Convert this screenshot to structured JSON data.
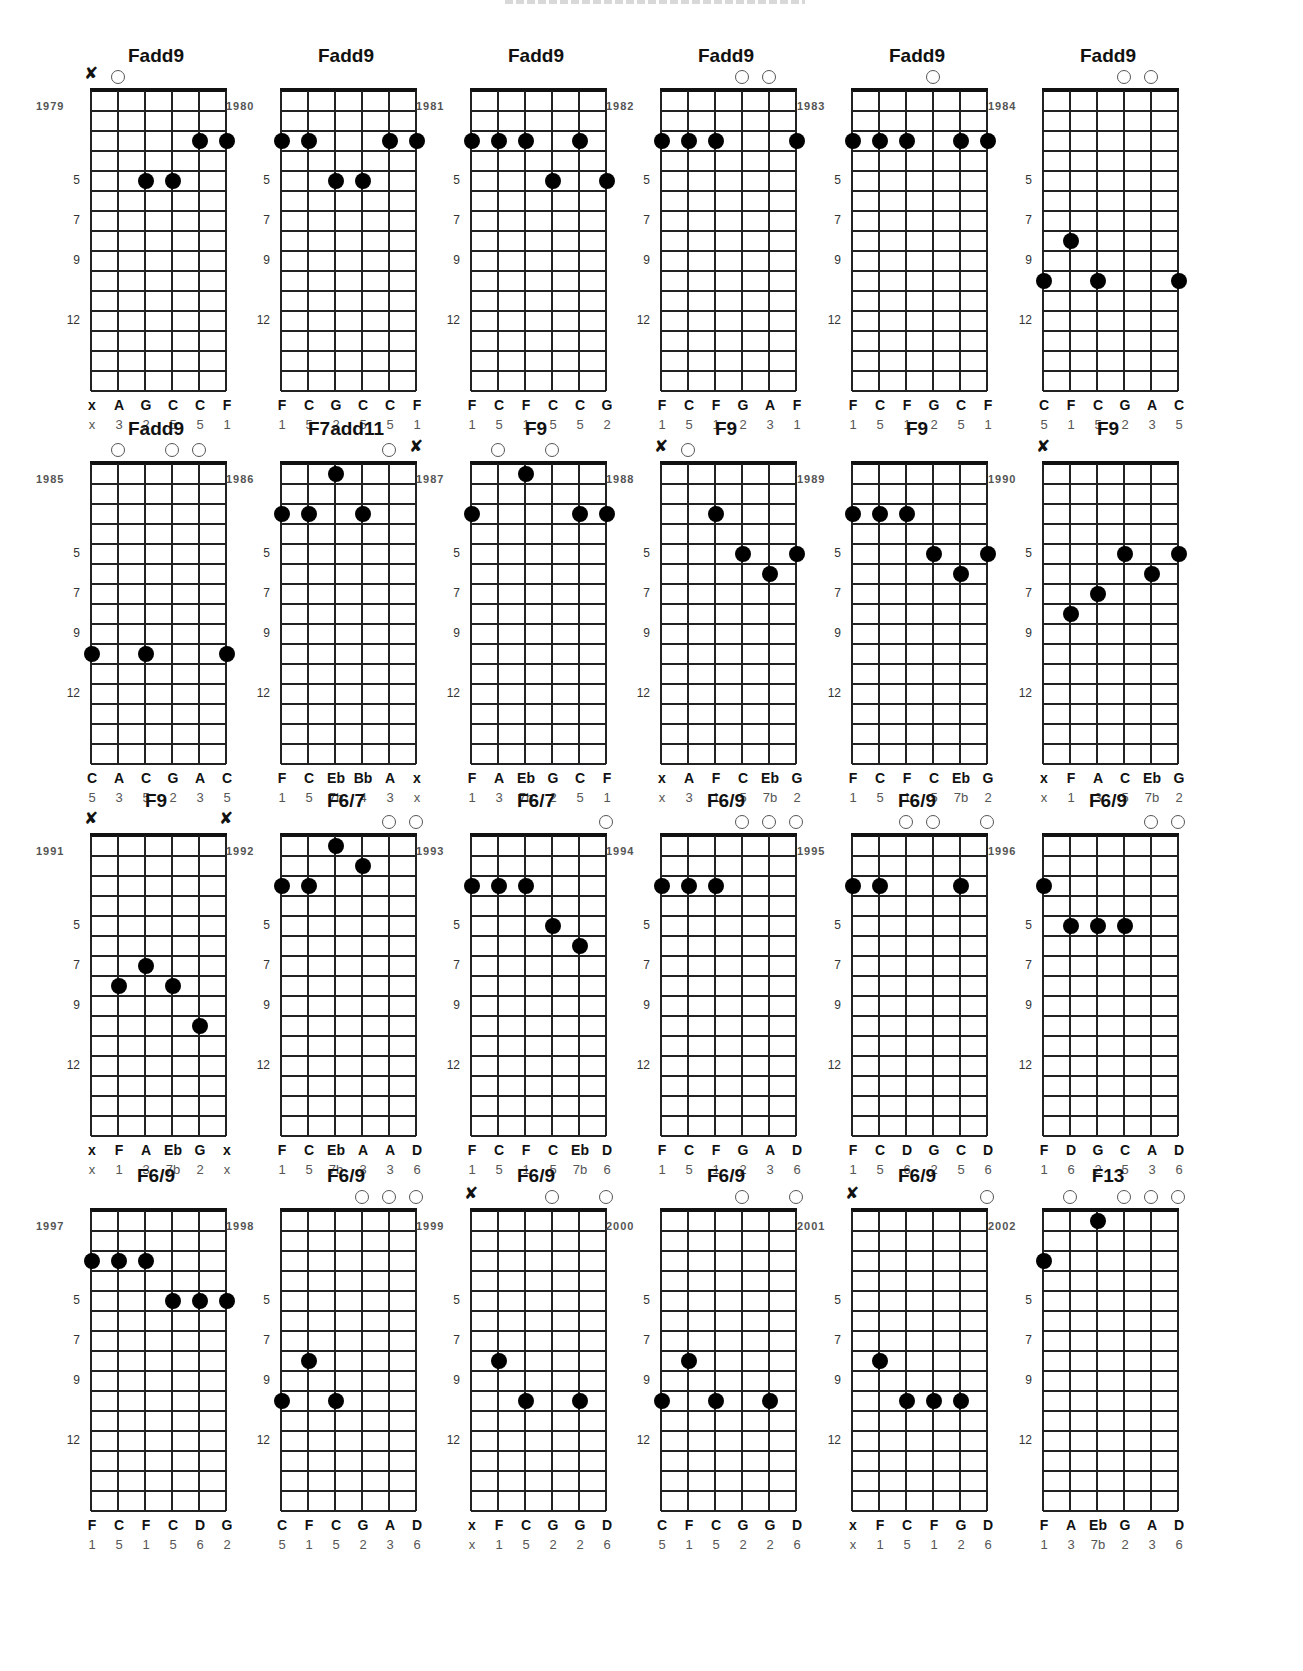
{
  "document": {
    "layout": {
      "columns": 6,
      "rows": 4,
      "strings": 6,
      "fret_spaces": 15
    },
    "fret_markers": [
      "5",
      "7",
      "9",
      "12"
    ],
    "colors": {
      "ink": "#111111",
      "secondary_text": "#555555",
      "background": "#ffffff"
    }
  },
  "chords": [
    {
      "year": "1979",
      "name": "Fadd9",
      "markers": [
        "x",
        "o",
        "",
        "",
        "",
        ""
      ],
      "dots": [
        [
          4,
          3
        ],
        [
          5,
          3
        ],
        [
          2,
          5
        ],
        [
          3,
          5
        ]
      ],
      "notes": [
        "x",
        "A",
        "G",
        "C",
        "C",
        "F"
      ],
      "degrees": [
        "x",
        "3",
        "2",
        "5",
        "5",
        "1"
      ]
    },
    {
      "year": "1980",
      "name": "Fadd9",
      "markers": [
        "",
        "",
        "",
        "",
        "",
        ""
      ],
      "dots": [
        [
          0,
          3
        ],
        [
          1,
          3
        ],
        [
          4,
          3
        ],
        [
          5,
          3
        ],
        [
          2,
          5
        ],
        [
          3,
          5
        ]
      ],
      "notes": [
        "F",
        "C",
        "G",
        "C",
        "C",
        "F"
      ],
      "degrees": [
        "1",
        "5",
        "2",
        "5",
        "5",
        "1"
      ]
    },
    {
      "year": "1981",
      "name": "Fadd9",
      "markers": [
        "",
        "",
        "",
        "",
        "",
        ""
      ],
      "dots": [
        [
          0,
          3
        ],
        [
          1,
          3
        ],
        [
          2,
          3
        ],
        [
          4,
          3
        ],
        [
          3,
          5
        ],
        [
          5,
          5
        ]
      ],
      "notes": [
        "F",
        "C",
        "F",
        "C",
        "C",
        "G"
      ],
      "degrees": [
        "1",
        "5",
        "1",
        "5",
        "5",
        "2"
      ]
    },
    {
      "year": "1982",
      "name": "Fadd9",
      "markers": [
        "",
        "",
        "",
        "o",
        "o",
        ""
      ],
      "dots": [
        [
          0,
          3
        ],
        [
          1,
          3
        ],
        [
          2,
          3
        ],
        [
          5,
          3
        ]
      ],
      "notes": [
        "F",
        "C",
        "F",
        "G",
        "A",
        "F"
      ],
      "degrees": [
        "1",
        "5",
        "1",
        "2",
        "3",
        "1"
      ]
    },
    {
      "year": "1983",
      "name": "Fadd9",
      "markers": [
        "",
        "",
        "",
        "o",
        "",
        ""
      ],
      "dots": [
        [
          0,
          3
        ],
        [
          1,
          3
        ],
        [
          2,
          3
        ],
        [
          4,
          3
        ],
        [
          5,
          3
        ]
      ],
      "notes": [
        "F",
        "C",
        "F",
        "G",
        "C",
        "F"
      ],
      "degrees": [
        "1",
        "5",
        "1",
        "2",
        "5",
        "1"
      ]
    },
    {
      "year": "1984",
      "name": "Fadd9",
      "markers": [
        "",
        "",
        "",
        "o",
        "o",
        ""
      ],
      "dots": [
        [
          1,
          8
        ],
        [
          0,
          10
        ],
        [
          2,
          10
        ],
        [
          5,
          10
        ]
      ],
      "notes": [
        "C",
        "F",
        "C",
        "G",
        "A",
        "C"
      ],
      "degrees": [
        "5",
        "1",
        "5",
        "2",
        "3",
        "5"
      ]
    },
    {
      "year": "1985",
      "name": "Fadd9",
      "markers": [
        "",
        "o",
        "",
        "o",
        "o",
        ""
      ],
      "dots": [
        [
          0,
          10
        ],
        [
          2,
          10
        ],
        [
          5,
          10
        ]
      ],
      "notes": [
        "C",
        "A",
        "C",
        "G",
        "A",
        "C"
      ],
      "degrees": [
        "5",
        "3",
        "5",
        "2",
        "3",
        "5"
      ]
    },
    {
      "year": "1986",
      "name": "F7add11",
      "markers": [
        "",
        "",
        "",
        "",
        "o",
        "x"
      ],
      "dots": [
        [
          2,
          1
        ],
        [
          0,
          3
        ],
        [
          1,
          3
        ],
        [
          3,
          3
        ]
      ],
      "notes": [
        "F",
        "C",
        "Eb",
        "Bb",
        "A",
        "x"
      ],
      "degrees": [
        "1",
        "5",
        "7b",
        "4",
        "3",
        "x"
      ]
    },
    {
      "year": "1987",
      "name": "F9",
      "markers": [
        "",
        "o",
        "",
        "o",
        "",
        ""
      ],
      "dots": [
        [
          2,
          1
        ],
        [
          0,
          3
        ],
        [
          4,
          3
        ],
        [
          5,
          3
        ]
      ],
      "notes": [
        "F",
        "A",
        "Eb",
        "G",
        "C",
        "F"
      ],
      "degrees": [
        "1",
        "3",
        "7b",
        "2",
        "5",
        "1"
      ]
    },
    {
      "year": "1988",
      "name": "F9",
      "markers": [
        "x",
        "o",
        "",
        "",
        "",
        ""
      ],
      "dots": [
        [
          2,
          3
        ],
        [
          3,
          5
        ],
        [
          5,
          5
        ],
        [
          4,
          6
        ]
      ],
      "notes": [
        "x",
        "A",
        "F",
        "C",
        "Eb",
        "G"
      ],
      "degrees": [
        "x",
        "3",
        "1",
        "5",
        "7b",
        "2"
      ]
    },
    {
      "year": "1989",
      "name": "F9",
      "markers": [
        "",
        "",
        "",
        "",
        "",
        ""
      ],
      "dots": [
        [
          0,
          3
        ],
        [
          1,
          3
        ],
        [
          2,
          3
        ],
        [
          3,
          5
        ],
        [
          5,
          5
        ],
        [
          4,
          6
        ]
      ],
      "notes": [
        "F",
        "C",
        "F",
        "C",
        "Eb",
        "G"
      ],
      "degrees": [
        "1",
        "5",
        "1",
        "5",
        "7b",
        "2"
      ]
    },
    {
      "year": "1990",
      "name": "F9",
      "markers": [
        "x",
        "",
        "",
        "",
        "",
        ""
      ],
      "dots": [
        [
          3,
          5
        ],
        [
          5,
          5
        ],
        [
          4,
          6
        ],
        [
          2,
          7
        ],
        [
          1,
          8
        ]
      ],
      "notes": [
        "x",
        "F",
        "A",
        "C",
        "Eb",
        "G"
      ],
      "degrees": [
        "x",
        "1",
        "3",
        "5",
        "7b",
        "2"
      ]
    },
    {
      "year": "1991",
      "name": "F9",
      "markers": [
        "x",
        "",
        "",
        "",
        "",
        "x"
      ],
      "dots": [
        [
          2,
          7
        ],
        [
          1,
          8
        ],
        [
          3,
          8
        ],
        [
          4,
          10
        ]
      ],
      "notes": [
        "x",
        "F",
        "A",
        "Eb",
        "G",
        "x"
      ],
      "degrees": [
        "x",
        "1",
        "3",
        "7b",
        "2",
        "x"
      ]
    },
    {
      "year": "1992",
      "name": "F6/7",
      "markers": [
        "",
        "",
        "",
        "",
        "o",
        "o"
      ],
      "dots": [
        [
          2,
          1
        ],
        [
          3,
          2
        ],
        [
          0,
          3
        ],
        [
          1,
          3
        ]
      ],
      "notes": [
        "F",
        "C",
        "Eb",
        "A",
        "A",
        "D"
      ],
      "degrees": [
        "1",
        "5",
        "7b",
        "3",
        "3",
        "6"
      ]
    },
    {
      "year": "1993",
      "name": "F6/7",
      "markers": [
        "",
        "",
        "",
        "",
        "",
        "o"
      ],
      "dots": [
        [
          0,
          3
        ],
        [
          1,
          3
        ],
        [
          2,
          3
        ],
        [
          3,
          5
        ],
        [
          4,
          6
        ]
      ],
      "notes": [
        "F",
        "C",
        "F",
        "C",
        "Eb",
        "D"
      ],
      "degrees": [
        "1",
        "5",
        "1",
        "5",
        "7b",
        "6"
      ]
    },
    {
      "year": "1994",
      "name": "F6/9",
      "markers": [
        "",
        "",
        "",
        "o",
        "o",
        "o"
      ],
      "dots": [
        [
          0,
          3
        ],
        [
          1,
          3
        ],
        [
          2,
          3
        ]
      ],
      "notes": [
        "F",
        "C",
        "F",
        "G",
        "A",
        "D"
      ],
      "degrees": [
        "1",
        "5",
        "1",
        "2",
        "3",
        "6"
      ]
    },
    {
      "year": "1995",
      "name": "F6/9",
      "markers": [
        "",
        "",
        "o",
        "o",
        "",
        "o"
      ],
      "dots": [
        [
          0,
          3
        ],
        [
          1,
          3
        ],
        [
          4,
          3
        ]
      ],
      "notes": [
        "F",
        "C",
        "D",
        "G",
        "C",
        "D"
      ],
      "degrees": [
        "1",
        "5",
        "6",
        "2",
        "5",
        "6"
      ]
    },
    {
      "year": "1996",
      "name": "F6/9",
      "markers": [
        "",
        "",
        "",
        "",
        "o",
        "o"
      ],
      "dots": [
        [
          0,
          3
        ],
        [
          1,
          5
        ],
        [
          2,
          5
        ],
        [
          3,
          5
        ]
      ],
      "notes": [
        "F",
        "D",
        "G",
        "C",
        "A",
        "D"
      ],
      "degrees": [
        "1",
        "6",
        "2",
        "5",
        "3",
        "6"
      ]
    },
    {
      "year": "1997",
      "name": "F6/9",
      "markers": [
        "",
        "",
        "",
        "",
        "",
        ""
      ],
      "dots": [
        [
          0,
          3
        ],
        [
          1,
          3
        ],
        [
          2,
          3
        ],
        [
          3,
          5
        ],
        [
          4,
          5
        ],
        [
          5,
          5
        ]
      ],
      "notes": [
        "F",
        "C",
        "F",
        "C",
        "D",
        "G"
      ],
      "degrees": [
        "1",
        "5",
        "1",
        "5",
        "6",
        "2"
      ]
    },
    {
      "year": "1998",
      "name": "F6/9",
      "markers": [
        "",
        "",
        "",
        "o",
        "o",
        "o"
      ],
      "dots": [
        [
          1,
          8
        ],
        [
          0,
          10
        ],
        [
          2,
          10
        ]
      ],
      "notes": [
        "C",
        "F",
        "C",
        "G",
        "A",
        "D"
      ],
      "degrees": [
        "5",
        "1",
        "5",
        "2",
        "3",
        "6"
      ]
    },
    {
      "year": "1999",
      "name": "F6/9",
      "markers": [
        "x",
        "",
        "",
        "o",
        "",
        "o"
      ],
      "dots": [
        [
          1,
          8
        ],
        [
          2,
          10
        ],
        [
          4,
          10
        ]
      ],
      "notes": [
        "x",
        "F",
        "C",
        "G",
        "G",
        "D"
      ],
      "degrees": [
        "x",
        "1",
        "5",
        "2",
        "2",
        "6"
      ]
    },
    {
      "year": "2000",
      "name": "F6/9",
      "markers": [
        "",
        "",
        "",
        "o",
        "",
        "o"
      ],
      "dots": [
        [
          1,
          8
        ],
        [
          0,
          10
        ],
        [
          2,
          10
        ],
        [
          4,
          10
        ]
      ],
      "notes": [
        "C",
        "F",
        "C",
        "G",
        "G",
        "D"
      ],
      "degrees": [
        "5",
        "1",
        "5",
        "2",
        "2",
        "6"
      ]
    },
    {
      "year": "2001",
      "name": "F6/9",
      "markers": [
        "x",
        "",
        "",
        "",
        "",
        "o"
      ],
      "dots": [
        [
          1,
          8
        ],
        [
          2,
          10
        ],
        [
          3,
          10
        ],
        [
          4,
          10
        ]
      ],
      "notes": [
        "x",
        "F",
        "C",
        "F",
        "G",
        "D"
      ],
      "degrees": [
        "x",
        "1",
        "5",
        "1",
        "2",
        "6"
      ]
    },
    {
      "year": "2002",
      "name": "F13",
      "markers": [
        "",
        "o",
        "",
        "o",
        "o",
        "o"
      ],
      "dots": [
        [
          2,
          1
        ],
        [
          0,
          3
        ]
      ],
      "notes": [
        "F",
        "A",
        "Eb",
        "G",
        "A",
        "D"
      ],
      "degrees": [
        "1",
        "3",
        "7b",
        "2",
        "3",
        "6"
      ]
    }
  ]
}
